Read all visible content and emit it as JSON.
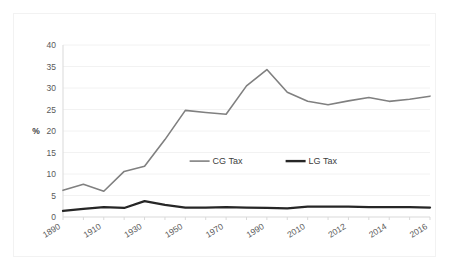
{
  "chart_data": {
    "type": "line",
    "title": "",
    "xlabel": "",
    "ylabel": "%",
    "ylim": [
      0,
      40
    ],
    "ytick_values": [
      0,
      5,
      10,
      15,
      20,
      25,
      30,
      35,
      40
    ],
    "ytick_labels": [
      "0",
      "5",
      "10",
      "15",
      "20",
      "25",
      "30",
      "35",
      "40"
    ],
    "grid": true,
    "grid_axis": "y",
    "legend_position": "center",
    "categories": [
      "1890",
      "1900",
      "1910",
      "1920",
      "1930",
      "1940",
      "1950",
      "1960",
      "1970",
      "1980",
      "1990",
      "2000",
      "2010",
      "2011",
      "2012",
      "2013",
      "2014",
      "2015",
      "2016"
    ],
    "xtick_labels_shown": [
      "1890",
      "1910",
      "1930",
      "1950",
      "1970",
      "1990",
      "2010",
      "2012",
      "2014",
      "2016"
    ],
    "series": [
      {
        "name": "CG Tax",
        "color": "#808080",
        "values": [
          6.2,
          7.6,
          6.0,
          10.6,
          11.8,
          18.0,
          24.8,
          24.3,
          23.9,
          30.5,
          34.3,
          29.0,
          26.9,
          26.1,
          27.0,
          27.8,
          26.9,
          27.4,
          28.1
        ]
      },
      {
        "name": "LG Tax",
        "color": "#262626",
        "values": [
          1.4,
          1.9,
          2.3,
          2.1,
          3.7,
          2.8,
          2.2,
          2.2,
          2.3,
          2.2,
          2.1,
          2.0,
          2.4,
          2.4,
          2.4,
          2.3,
          2.3,
          2.3,
          2.2
        ]
      }
    ]
  },
  "legend": {
    "items": [
      {
        "label": "CG Tax",
        "color": "#808080",
        "width": 1.6
      },
      {
        "label": "LG Tax",
        "color": "#262626",
        "width": 2.4
      }
    ]
  },
  "colors": {
    "background": "#ffffff",
    "border": "#f2f2f2",
    "gridline": "#f2f2f2",
    "axis": "#d9d9d9",
    "tick_text": "#595959",
    "cg_tax": "#808080",
    "lg_tax": "#262626"
  }
}
